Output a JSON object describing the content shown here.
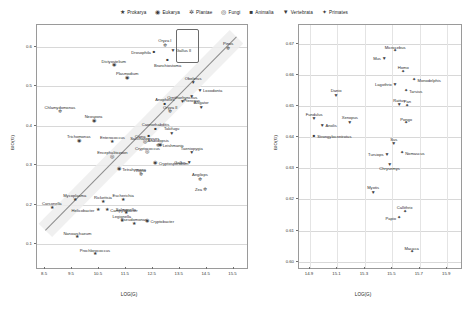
{
  "legend": {
    "items": [
      {
        "label": "Prokarya",
        "glyph": "★",
        "key": "prokarya"
      },
      {
        "label": "Eukarya",
        "glyph": "◉",
        "key": "eukarya"
      },
      {
        "label": "Plantae",
        "glyph": "✲",
        "key": "plantae"
      },
      {
        "label": "Fungi",
        "glyph": "◎",
        "key": "fungi"
      },
      {
        "label": "Animalia",
        "glyph": "■",
        "key": "animalia"
      },
      {
        "label": "Vertebrata",
        "glyph": "▼",
        "key": "vertebrata"
      },
      {
        "label": "Primates",
        "glyph": "✦",
        "key": "primates"
      }
    ]
  },
  "chart_data": [
    {
      "panel": "left",
      "type": "scatter",
      "title": "",
      "xlabel": "LOG(G)",
      "ylabel": "BIO(G)",
      "xlim": [
        8.2,
        16.0
      ],
      "ylim": [
        0.04,
        0.655
      ],
      "xticks": [
        8.5,
        9.5,
        10.5,
        11.5,
        12.5,
        13.5,
        14.5,
        15.5
      ],
      "yticks": [
        0.1,
        0.2,
        0.3,
        0.4,
        0.5,
        0.6
      ],
      "grid": true,
      "legend_position": "top-center",
      "trend": {
        "x0": 8.5,
        "y0": 0.135,
        "x1": 15.6,
        "y1": 0.625,
        "band": true
      },
      "annotations": [
        {
          "type": "rect",
          "x0": 13.35,
          "y0": 0.565,
          "x1": 14.15,
          "y1": 0.645
        }
      ],
      "points": [
        {
          "name": "Chlamydomonas",
          "group": "plantae",
          "x": 9.05,
          "y": 0.437,
          "lab": "above"
        },
        {
          "name": "Neospora",
          "group": "eukarya",
          "x": 10.3,
          "y": 0.413,
          "lab": "above"
        },
        {
          "name": "Dictyostelium",
          "group": "eukarya",
          "x": 11.05,
          "y": 0.553,
          "lab": "above"
        },
        {
          "name": "Plasmodium",
          "group": "eukarya",
          "x": 11.55,
          "y": 0.521,
          "lab": "above"
        },
        {
          "name": "Trichomonas",
          "group": "eukarya",
          "x": 9.75,
          "y": 0.362,
          "lab": "above"
        },
        {
          "name": "Enterococcus",
          "group": "prokarya",
          "x": 11.0,
          "y": 0.36,
          "lab": "above"
        },
        {
          "name": "Encephalitozoon",
          "group": "fungi",
          "x": 11.0,
          "y": 0.322,
          "lab": "above"
        },
        {
          "name": "Saccharomyces",
          "group": "fungi",
          "x": 12.2,
          "y": 0.358,
          "lab": "above"
        },
        {
          "name": "Cryptococcus",
          "group": "fungi",
          "x": 12.3,
          "y": 0.333,
          "lab": "above"
        },
        {
          "name": "Cryptosporidium",
          "group": "eukarya",
          "x": 12.6,
          "y": 0.306,
          "lab": "right"
        },
        {
          "name": "Leishmania",
          "group": "eukarya",
          "x": 12.75,
          "y": 0.352,
          "lab": "right"
        },
        {
          "name": "Tetrahymena",
          "group": "eukarya",
          "x": 11.25,
          "y": 0.29,
          "lab": "right"
        },
        {
          "name": "Vigna",
          "group": "plantae",
          "x": 12.05,
          "y": 0.277,
          "lab": "above"
        },
        {
          "name": "Mycoplasma",
          "group": "prokarya",
          "x": 9.6,
          "y": 0.213,
          "lab": "above"
        },
        {
          "name": "Carsonella",
          "group": "prokarya",
          "x": 8.75,
          "y": 0.192,
          "lab": "above"
        },
        {
          "name": "Rickettsia",
          "group": "prokarya",
          "x": 10.65,
          "y": 0.208,
          "lab": "above"
        },
        {
          "name": "Escherichia",
          "group": "prokarya",
          "x": 11.4,
          "y": 0.212,
          "lab": "above"
        },
        {
          "name": "Helicobacter",
          "group": "prokarya",
          "x": 10.45,
          "y": 0.186,
          "lab": "left"
        },
        {
          "name": "Campylobacter",
          "group": "prokarya",
          "x": 10.8,
          "y": 0.186,
          "lab": "right"
        },
        {
          "name": "Salmonella",
          "group": "prokarya",
          "x": 11.5,
          "y": 0.178,
          "lab": "above"
        },
        {
          "name": "Legionella",
          "group": "prokarya",
          "x": 11.35,
          "y": 0.16,
          "lab": "above"
        },
        {
          "name": "Pseudomonas",
          "group": "prokarya",
          "x": 11.8,
          "y": 0.152,
          "lab": "above"
        },
        {
          "name": "Cryptobacter",
          "group": "eukarya",
          "x": 12.3,
          "y": 0.16,
          "lab": "right"
        },
        {
          "name": "Nanoarchaeum",
          "group": "prokarya",
          "x": 9.7,
          "y": 0.118,
          "lab": "above"
        },
        {
          "name": "Prochlorococcus",
          "group": "prokarya",
          "x": 10.35,
          "y": 0.075,
          "lab": "above"
        },
        {
          "name": "Caenorhabditis",
          "group": "animalia",
          "x": 12.6,
          "y": 0.392,
          "lab": "above"
        },
        {
          "name": "Ciona",
          "group": "animalia",
          "x": 12.35,
          "y": 0.375,
          "lab": "left"
        },
        {
          "name": "Arabidopsis",
          "group": "plantae",
          "x": 12.7,
          "y": 0.352,
          "lab": "above"
        },
        {
          "name": "Takifugu",
          "group": "vertebrata",
          "x": 13.2,
          "y": 0.382,
          "lab": "above"
        },
        {
          "name": "Anopheles",
          "group": "animalia",
          "x": 12.95,
          "y": 0.455,
          "lab": "above"
        },
        {
          "name": "Ornithorhynchus",
          "group": "vertebrata",
          "x": 13.6,
          "y": 0.462,
          "lab": "above"
        },
        {
          "name": "Oryza II",
          "group": "plantae",
          "x": 13.15,
          "y": 0.437,
          "lab": "above"
        },
        {
          "name": "Alligator",
          "group": "vertebrata",
          "x": 14.3,
          "y": 0.448,
          "lab": "above"
        },
        {
          "name": "Taeniopygia",
          "group": "vertebrata",
          "x": 13.95,
          "y": 0.333,
          "lab": "above"
        },
        {
          "name": "Gallus",
          "group": "vertebrata",
          "x": 13.85,
          "y": 0.308,
          "lab": "left"
        },
        {
          "name": "Aegilops",
          "group": "plantae",
          "x": 14.25,
          "y": 0.265,
          "lab": "above"
        },
        {
          "name": "Zea",
          "group": "plantae",
          "x": 14.45,
          "y": 0.24,
          "lab": "left"
        },
        {
          "name": "Oryza I",
          "group": "plantae",
          "x": 12.95,
          "y": 0.605,
          "lab": "above"
        },
        {
          "name": "Drosophila",
          "group": "animalia",
          "x": 12.55,
          "y": 0.586,
          "lab": "left"
        },
        {
          "name": "Gallus II",
          "group": "vertebrata",
          "x": 13.25,
          "y": 0.592,
          "lab": "right"
        },
        {
          "name": "Branchiostoma",
          "group": "animalia",
          "x": 13.05,
          "y": 0.566,
          "lab": "below"
        },
        {
          "name": "Obelerus",
          "group": "vertebrata",
          "x": 14.0,
          "y": 0.51,
          "lab": "above"
        },
        {
          "name": "Loxodonta",
          "group": "vertebrata",
          "x": 14.25,
          "y": 0.49,
          "lab": "right"
        },
        {
          "name": "Pteropus",
          "group": "vertebrata",
          "x": 13.95,
          "y": 0.476,
          "lab": "below"
        },
        {
          "name": "Pinus",
          "group": "plantae",
          "x": 15.3,
          "y": 0.598,
          "lab": "above"
        }
      ]
    },
    {
      "panel": "right",
      "type": "scatter",
      "title": "",
      "xlabel": "LOG(G)",
      "ylabel": "BIO(G)",
      "xlim": [
        14.82,
        16.0
      ],
      "ylim": [
        0.598,
        0.676
      ],
      "xticks": [
        14.9,
        15.1,
        15.3,
        15.5,
        15.7,
        15.9
      ],
      "yticks": [
        0.6,
        0.61,
        0.62,
        0.63,
        0.64,
        0.65,
        0.66,
        0.67
      ],
      "grid": true,
      "points": [
        {
          "name": "Microcebus",
          "group": "primates",
          "x": 15.52,
          "y": 0.6675,
          "lab": "above"
        },
        {
          "name": "Mus",
          "group": "vertebrata",
          "x": 15.44,
          "y": 0.6655,
          "lab": "left"
        },
        {
          "name": "Homo",
          "group": "primates",
          "x": 15.58,
          "y": 0.661,
          "lab": "above"
        },
        {
          "name": "Monodelphis",
          "group": "primates",
          "x": 15.66,
          "y": 0.6585,
          "lab": "right"
        },
        {
          "name": "Lagothrix",
          "group": "vertebrata",
          "x": 15.52,
          "y": 0.657,
          "lab": "left"
        },
        {
          "name": "Tarsius",
          "group": "primates",
          "x": 15.6,
          "y": 0.6548,
          "lab": "right"
        },
        {
          "name": "Danio",
          "group": "vertebrata",
          "x": 15.09,
          "y": 0.6535,
          "lab": "above"
        },
        {
          "name": "Rattus",
          "group": "vertebrata",
          "x": 15.55,
          "y": 0.6505,
          "lab": "above"
        },
        {
          "name": "Pan",
          "group": "primates",
          "x": 15.61,
          "y": 0.65,
          "lab": "above"
        },
        {
          "name": "Pongo",
          "group": "primates",
          "x": 15.6,
          "y": 0.6445,
          "lab": "above"
        },
        {
          "name": "Fundulus",
          "group": "vertebrata",
          "x": 14.93,
          "y": 0.646,
          "lab": "above"
        },
        {
          "name": "Anolis",
          "group": "vertebrata",
          "x": 14.99,
          "y": 0.644,
          "lab": "right"
        },
        {
          "name": "Xenopus",
          "group": "vertebrata",
          "x": 15.19,
          "y": 0.645,
          "lab": "above"
        },
        {
          "name": "Strongylocentrotus",
          "group": "animalia",
          "x": 14.93,
          "y": 0.6405,
          "lab": "right"
        },
        {
          "name": "Sus",
          "group": "vertebrata",
          "x": 15.51,
          "y": 0.638,
          "lab": "above"
        },
        {
          "name": "Nomascus",
          "group": "primates",
          "x": 15.57,
          "y": 0.635,
          "lab": "right"
        },
        {
          "name": "Tursiops",
          "group": "vertebrata",
          "x": 15.46,
          "y": 0.6345,
          "lab": "left"
        },
        {
          "name": "Chrysemys",
          "group": "vertebrata",
          "x": 15.48,
          "y": 0.6315,
          "lab": "below"
        },
        {
          "name": "Myotis",
          "group": "vertebrata",
          "x": 15.36,
          "y": 0.6225,
          "lab": "above"
        },
        {
          "name": "Callithrix",
          "group": "primates",
          "x": 15.59,
          "y": 0.616,
          "lab": "above"
        },
        {
          "name": "Papio",
          "group": "primates",
          "x": 15.55,
          "y": 0.614,
          "lab": "left"
        },
        {
          "name": "Macaca",
          "group": "primates",
          "x": 15.64,
          "y": 0.603,
          "lab": "above"
        }
      ]
    }
  ]
}
